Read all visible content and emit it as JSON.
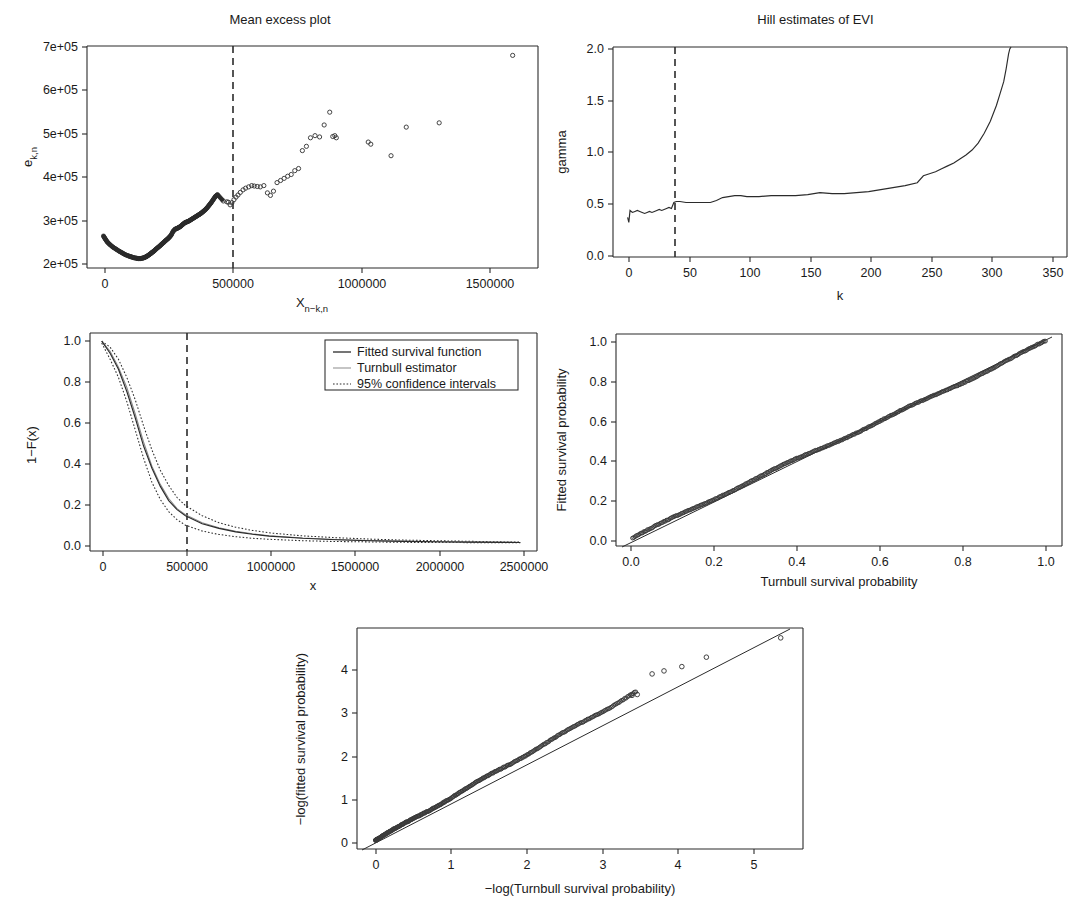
{
  "figure": {
    "kind": "multi-panel statistical diagnostic figure",
    "panel_count": 5,
    "background": "#ffffff",
    "ink": "#2b2b2b"
  },
  "panels": {
    "mean_excess": {
      "title": "Mean excess plot",
      "xlabel": "X",
      "xlabel_sub": "n−k,n",
      "ylabel": "e",
      "ylabel_sub": "k,n",
      "xticks": [
        "0",
        "500000",
        "1000000",
        "1500000"
      ],
      "xtick_values": [
        0,
        500000,
        1000000,
        1500000
      ],
      "yticks": [
        "2e+05",
        "3e+05",
        "4e+05",
        "5e+05",
        "6e+05",
        "7e+05"
      ],
      "ytick_values": [
        200000,
        300000,
        400000,
        500000,
        600000,
        700000
      ],
      "xlim": [
        -60000,
        1720000
      ],
      "ylim": [
        195000,
        715000
      ],
      "threshold_line_x": 500000,
      "threshold_style": "dashed vertical"
    },
    "hill": {
      "title": "Hill estimates of EVI",
      "xlabel": "k",
      "ylabel": "gamma",
      "xticks": [
        "0",
        "50",
        "100",
        "150",
        "200",
        "250",
        "300",
        "350"
      ],
      "xtick_values": [
        0,
        50,
        100,
        150,
        200,
        250,
        300,
        350
      ],
      "yticks": [
        "0.0",
        "0.5",
        "1.0",
        "1.5",
        "2.0"
      ],
      "ytick_values": [
        0.0,
        0.5,
        1.0,
        1.5,
        2.0
      ],
      "xlim": [
        -10,
        363
      ],
      "ylim": [
        -0.05,
        2.07
      ],
      "threshold_line_x": 38,
      "threshold_style": "dashed vertical"
    },
    "survival": {
      "xlabel": "x",
      "ylabel": "1−F(x)",
      "xticks": [
        "0",
        "500000",
        "1000000",
        "1500000",
        "2000000",
        "2500000"
      ],
      "xtick_values": [
        0,
        500000,
        1000000,
        1500000,
        2000000,
        2500000
      ],
      "yticks": [
        "0.0",
        "0.2",
        "0.4",
        "0.6",
        "0.8",
        "1.0"
      ],
      "ytick_values": [
        0.0,
        0.2,
        0.4,
        0.6,
        0.8,
        1.0
      ],
      "xlim": [
        -70000,
        2600000
      ],
      "ylim": [
        -0.04,
        1.04
      ],
      "threshold_line_x": 500000,
      "threshold_style": "dashed vertical",
      "legend": {
        "items": [
          {
            "label": "Fitted survival function",
            "style": "solid"
          },
          {
            "label": "Turnbull estimator",
            "style": "solid-light"
          },
          {
            "label": "95% confidence intervals",
            "style": "dotted"
          }
        ]
      }
    },
    "pp_plot": {
      "xlabel": "Turnbull survival probability",
      "ylabel": "Fitted survival probability",
      "xticks": [
        "0.0",
        "0.2",
        "0.4",
        "0.6",
        "0.8",
        "1.0"
      ],
      "xtick_values": [
        0.0,
        0.2,
        0.4,
        0.6,
        0.8,
        1.0
      ],
      "yticks": [
        "0.0",
        "0.2",
        "0.4",
        "0.6",
        "0.8",
        "1.0"
      ],
      "ytick_values": [
        0.0,
        0.2,
        0.4,
        0.6,
        0.8,
        1.0
      ],
      "xlim": [
        -0.04,
        1.04
      ],
      "ylim": [
        -0.04,
        1.04
      ],
      "reference_line": "y = x"
    },
    "qq_log": {
      "xlabel": "−log(Turnbull survival probability)",
      "ylabel": "−log(fitted survival probability)",
      "xticks": [
        "0",
        "1",
        "2",
        "3",
        "4",
        "5"
      ],
      "xtick_values": [
        0,
        1,
        2,
        3,
        4,
        5
      ],
      "yticks": [
        "0",
        "1",
        "2",
        "3",
        "4"
      ],
      "ytick_values": [
        0,
        1,
        2,
        3,
        4
      ],
      "xlim": [
        -0.25,
        5.75
      ],
      "ylim": [
        -0.2,
        4.95
      ],
      "reference_line": "y = x"
    }
  },
  "chart_data": [
    {
      "type": "scatter",
      "id": "mean_excess",
      "title": "Mean excess plot",
      "xlabel": "X_{n-k,n}",
      "ylabel": "e_{k,n}",
      "xlim": [
        -60000,
        1720000
      ],
      "ylim": [
        195000,
        715000
      ],
      "grid": false,
      "annotations": [
        {
          "type": "vline",
          "x": 500000,
          "style": "dashed"
        }
      ],
      "x": [
        5000,
        12000,
        20000,
        30000,
        42000,
        55000,
        68000,
        80000,
        92000,
        105000,
        115000,
        125000,
        135000,
        142000,
        150000,
        158000,
        165000,
        172000,
        178000,
        185000,
        192000,
        198000,
        205000,
        212000,
        220000,
        228000,
        235000,
        243000,
        250000,
        258000,
        265000,
        272000,
        280000,
        288000,
        296000,
        303000,
        310000,
        318000,
        326000,
        334000,
        342000,
        350000,
        358000,
        366000,
        374000,
        382000,
        390000,
        398000,
        406000,
        414000,
        422000,
        430000,
        438000,
        446000,
        455000,
        478000,
        492000,
        498000,
        505000,
        512000,
        520000,
        528000,
        536000,
        545000,
        556000,
        566000,
        578000,
        590000,
        600000,
        612000,
        624000,
        638000,
        652000,
        664000,
        676000,
        690000,
        704000,
        718000,
        732000,
        746000,
        760000,
        775000,
        790000,
        806000,
        822000,
        840000,
        858000,
        876000,
        898000,
        910000,
        918000,
        924000,
        1050000,
        1060000,
        1140000,
        1200000,
        1330000,
        1620000
      ],
      "y": [
        270000,
        263000,
        256000,
        250000,
        244000,
        239000,
        234000,
        230000,
        226000,
        223000,
        221000,
        219000,
        218000,
        217000,
        217000,
        218000,
        219000,
        221000,
        223000,
        226000,
        229000,
        232000,
        235000,
        239000,
        243000,
        247000,
        251000,
        255000,
        259000,
        263000,
        267000,
        272000,
        281000,
        286000,
        288000,
        290000,
        293000,
        297000,
        301000,
        303000,
        305000,
        308000,
        311000,
        314000,
        317000,
        320000,
        323000,
        327000,
        331000,
        336000,
        342000,
        348000,
        355000,
        362000,
        367000,
        352000,
        350000,
        349000,
        343000,
        348000,
        355000,
        361000,
        366000,
        372000,
        378000,
        382000,
        385000,
        388000,
        387000,
        386000,
        385000,
        388000,
        371000,
        365000,
        375000,
        395000,
        400000,
        405000,
        410000,
        414000,
        423000,
        428000,
        470000,
        480000,
        500000,
        505000,
        502000,
        530000,
        560000,
        503000,
        505000,
        500000,
        490000,
        485000,
        458000,
        525000,
        535000,
        693000
      ]
    },
    {
      "type": "line",
      "id": "hill",
      "title": "Hill estimates of EVI",
      "xlabel": "k",
      "ylabel": "gamma",
      "xlim": [
        -10,
        363
      ],
      "ylim": [
        -0.05,
        2.07
      ],
      "grid": false,
      "annotations": [
        {
          "type": "vline",
          "x": 38,
          "style": "dashed"
        }
      ],
      "x": [
        2,
        3,
        4,
        5,
        6,
        8,
        10,
        12,
        14,
        16,
        18,
        20,
        22,
        24,
        26,
        28,
        30,
        32,
        34,
        36,
        38,
        40,
        42,
        45,
        50,
        55,
        60,
        65,
        70,
        75,
        80,
        85,
        90,
        95,
        100,
        110,
        120,
        130,
        140,
        150,
        160,
        170,
        180,
        190,
        200,
        210,
        220,
        230,
        240,
        245,
        250,
        255,
        260,
        265,
        270,
        275,
        280,
        285,
        290,
        295,
        300,
        305,
        308,
        311,
        313,
        315,
        316,
        317
      ],
      "y": [
        0.35,
        0.3,
        0.42,
        0.41,
        0.4,
        0.41,
        0.42,
        0.41,
        0.4,
        0.39,
        0.4,
        0.41,
        0.4,
        0.41,
        0.42,
        0.43,
        0.42,
        0.43,
        0.44,
        0.45,
        0.44,
        0.5,
        0.51,
        0.51,
        0.5,
        0.5,
        0.5,
        0.5,
        0.5,
        0.52,
        0.55,
        0.56,
        0.57,
        0.57,
        0.56,
        0.56,
        0.57,
        0.57,
        0.57,
        0.58,
        0.6,
        0.59,
        0.59,
        0.6,
        0.61,
        0.63,
        0.65,
        0.67,
        0.7,
        0.77,
        0.79,
        0.81,
        0.84,
        0.87,
        0.9,
        0.94,
        0.98,
        1.03,
        1.1,
        1.2,
        1.32,
        1.48,
        1.6,
        1.72,
        1.85,
        2.0,
        2.05,
        2.07
      ]
    },
    {
      "type": "line",
      "id": "survival",
      "xlabel": "x",
      "ylabel": "1-F(x)",
      "xlim": [
        -70000,
        2600000
      ],
      "ylim": [
        -0.04,
        1.04
      ],
      "grid": false,
      "annotations": [
        {
          "type": "vline",
          "x": 500000,
          "style": "dashed"
        }
      ],
      "series": [
        {
          "name": "Fitted survival function",
          "style": "solid",
          "x": [
            0,
            50000,
            100000,
            150000,
            200000,
            250000,
            300000,
            350000,
            400000,
            450000,
            500000,
            600000,
            700000,
            800000,
            900000,
            1000000,
            1200000,
            1400000,
            1600000,
            1800000,
            2000000,
            2200000,
            2400000,
            2500000
          ],
          "y": [
            1.0,
            0.94,
            0.86,
            0.75,
            0.62,
            0.48,
            0.37,
            0.28,
            0.21,
            0.165,
            0.135,
            0.095,
            0.072,
            0.055,
            0.043,
            0.034,
            0.023,
            0.016,
            0.011,
            0.008,
            0.006,
            0.004,
            0.003,
            0.002
          ]
        },
        {
          "name": "Turnbull estimator",
          "style": "solid-light",
          "x": [
            0,
            50000,
            100000,
            150000,
            200000,
            250000,
            300000,
            350000,
            400000,
            450000,
            500000,
            600000,
            700000,
            800000,
            900000,
            1000000,
            1200000,
            1400000,
            1600000,
            1800000,
            2000000,
            2200000,
            2400000,
            2500000
          ],
          "y": [
            1.0,
            0.95,
            0.87,
            0.77,
            0.64,
            0.5,
            0.38,
            0.29,
            0.22,
            0.17,
            0.14,
            0.1,
            0.075,
            0.058,
            0.045,
            0.036,
            0.024,
            0.017,
            0.012,
            0.009,
            0.006,
            0.004,
            0.003,
            0.002
          ]
        },
        {
          "name": "95% confidence intervals upper",
          "style": "dotted",
          "x": [
            0,
            50000,
            100000,
            150000,
            200000,
            250000,
            300000,
            350000,
            400000,
            450000,
            500000,
            600000,
            700000,
            800000,
            900000,
            1000000,
            1200000,
            1400000,
            1600000,
            1800000,
            2000000,
            2200000,
            2400000,
            2500000
          ],
          "y": [
            1.0,
            0.97,
            0.91,
            0.82,
            0.71,
            0.58,
            0.46,
            0.36,
            0.285,
            0.225,
            0.185,
            0.135,
            0.1,
            0.078,
            0.062,
            0.05,
            0.035,
            0.026,
            0.019,
            0.014,
            0.011,
            0.008,
            0.005,
            0.004
          ]
        },
        {
          "name": "95% confidence intervals lower",
          "style": "dotted",
          "x": [
            0,
            50000,
            100000,
            150000,
            200000,
            250000,
            300000,
            350000,
            400000,
            450000,
            500000,
            600000,
            700000,
            800000,
            900000,
            1000000,
            1200000,
            1400000,
            1600000,
            1800000,
            2000000,
            2200000,
            2400000,
            2500000
          ],
          "y": [
            0.99,
            0.91,
            0.82,
            0.7,
            0.56,
            0.42,
            0.3,
            0.215,
            0.155,
            0.115,
            0.088,
            0.059,
            0.042,
            0.031,
            0.023,
            0.018,
            0.011,
            0.007,
            0.005,
            0.003,
            0.002,
            0.0015,
            0.001,
            0.001
          ]
        }
      ]
    },
    {
      "type": "scatter",
      "id": "pp_plot",
      "xlabel": "Turnbull survival probability",
      "ylabel": "Fitted survival probability",
      "xlim": [
        -0.04,
        1.04
      ],
      "ylim": [
        -0.04,
        1.04
      ],
      "grid": false,
      "annotations": [
        {
          "type": "line",
          "desc": "y = x reference"
        }
      ],
      "note": "dense band of points lying essentially on the 1:1 diagonal"
    },
    {
      "type": "scatter",
      "id": "qq_log",
      "xlabel": "-log(Turnbull survival probability)",
      "ylabel": "-log(fitted survival probability)",
      "xlim": [
        -0.25,
        5.75
      ],
      "ylim": [
        -0.2,
        4.95
      ],
      "grid": false,
      "annotations": [
        {
          "type": "line",
          "desc": "y = x reference"
        }
      ],
      "note": "dense diagonal band; upper-tail points fall slightly below the reference line",
      "outliers": [
        {
          "x": 3.45,
          "y": 3.38
        },
        {
          "x": 3.52,
          "y": 3.4
        },
        {
          "x": 3.72,
          "y": 3.88
        },
        {
          "x": 3.88,
          "y": 3.95
        },
        {
          "x": 4.12,
          "y": 4.05
        },
        {
          "x": 4.45,
          "y": 4.27
        },
        {
          "x": 5.45,
          "y": 4.72
        }
      ]
    }
  ]
}
